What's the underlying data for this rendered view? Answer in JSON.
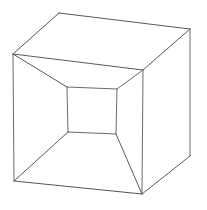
{
  "figure": {
    "type": "line-drawing",
    "canvas": {
      "width": 207,
      "height": 210,
      "background_color": "#ffffff"
    },
    "style": {
      "stroke_color": "#6b6b6b",
      "stroke_color_dark": "#4a4a4a",
      "stroke_width": 1,
      "fill": "none"
    },
    "vertices": {
      "outer_top_left": [
        13,
        54
      ],
      "outer_top_apex": [
        59,
        13
      ],
      "outer_top_right": [
        190,
        29
      ],
      "outer_right_mid": [
        143,
        70
      ],
      "outer_right_bottom": [
        190,
        156
      ],
      "outer_bottom_center": [
        142,
        194
      ],
      "outer_bottom_left": [
        14,
        181
      ],
      "inner_top_left": [
        67,
        87
      ],
      "inner_top_right": [
        117,
        89
      ],
      "inner_bottom_right": [
        116,
        134
      ],
      "inner_bottom_left": [
        68,
        132
      ]
    },
    "edges": [
      {
        "name": "outer-top-left-rising",
        "points": "13,54 59,13"
      },
      {
        "name": "outer-top-back",
        "points": "59,13 190,29"
      },
      {
        "name": "outer-top-right-descending",
        "points": "190,29 143,70"
      },
      {
        "name": "outer-top-front",
        "points": "143,70 13,54"
      },
      {
        "name": "outer-left-vertical",
        "points": "13,54 14,181"
      },
      {
        "name": "outer-right-far-vertical",
        "points": "190,29 190,156"
      },
      {
        "name": "outer-middle-vertical",
        "points": "143,70 142,194"
      },
      {
        "name": "outer-bottom-front",
        "points": "14,181 142,194"
      },
      {
        "name": "outer-bottom-right",
        "points": "142,194 190,156"
      },
      {
        "name": "inner-top",
        "points": "67,87 117,89"
      },
      {
        "name": "inner-right",
        "points": "117,89 116,134"
      },
      {
        "name": "inner-bottom",
        "points": "116,134 68,132"
      },
      {
        "name": "inner-left",
        "points": "68,132 67,87"
      },
      {
        "name": "receding-top-left",
        "points": "13,54 67,87"
      },
      {
        "name": "receding-top-right",
        "points": "143,70 117,89"
      },
      {
        "name": "receding-bottom-left",
        "points": "14,181 68,132"
      },
      {
        "name": "receding-bottom-right",
        "points": "142,194 116,134"
      }
    ]
  }
}
